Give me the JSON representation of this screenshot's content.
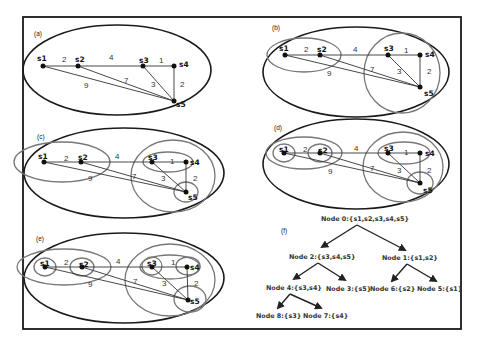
{
  "figure": {
    "frame_color": "#1a1a1a",
    "node_color": "#111111",
    "cluster_color": "#777777",
    "panels": [
      {
        "id": "a",
        "label": "(a)"
      },
      {
        "id": "b",
        "label": "(b)"
      },
      {
        "id": "c",
        "label": "(c)"
      },
      {
        "id": "d",
        "label": "(d)"
      },
      {
        "id": "e",
        "label": "(e)"
      },
      {
        "id": "f",
        "label": "(f)"
      }
    ],
    "nodes": [
      "s1",
      "s2",
      "s3",
      "s4",
      "s5"
    ],
    "edges": [
      {
        "from": "s1",
        "to": "s2",
        "weight": "2"
      },
      {
        "from": "s2",
        "to": "s3",
        "weight": "4"
      },
      {
        "from": "s3",
        "to": "s4",
        "weight": "1"
      },
      {
        "from": "s4",
        "to": "s5",
        "weight": "2"
      },
      {
        "from": "s3",
        "to": "s5",
        "weight": "3"
      },
      {
        "from": "s2",
        "to": "s5",
        "weight": "7"
      },
      {
        "from": "s1",
        "to": "s5",
        "weight": "9"
      }
    ],
    "tree": {
      "node0": "Node 0:{s1,s2,s3,s4,s5}",
      "node1": "Node 1:{s1,s2}",
      "node2": "Node 2:{s3,s4,s5}",
      "node3": "Node 3:{s5}",
      "node4": "Node 4:{s3,s4}",
      "node5": "Node 5:{s1}",
      "node6": "Node 6:{s2}",
      "node7": "Node 7:{s4}",
      "node8": "Node 8:{s3}"
    }
  }
}
